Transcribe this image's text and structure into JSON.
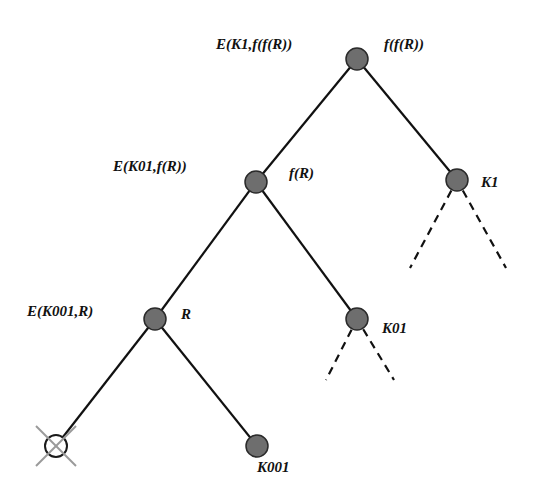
{
  "diagram": {
    "title": "",
    "colors": {
      "node_fill": "#6e6e6e",
      "node_stroke": "#2a2a2a",
      "edge": "#111111",
      "cross": "#9a9a9a",
      "label": "#111111"
    },
    "nodes": [
      {
        "id": "root",
        "x": 357,
        "y": 59,
        "type": "filled",
        "left_label": "E(K1,f(f(R))",
        "right_label": "f(f(R))"
      },
      {
        "id": "fR",
        "x": 256,
        "y": 182,
        "type": "filled",
        "left_label": "E(K01,f(R))",
        "right_label": "f(R)"
      },
      {
        "id": "K1",
        "x": 457,
        "y": 180,
        "type": "filled",
        "left_label": "",
        "right_label": "K1"
      },
      {
        "id": "R",
        "x": 155,
        "y": 319,
        "type": "filled",
        "left_label": "E(K001,R)",
        "right_label": "R"
      },
      {
        "id": "K01",
        "x": 357,
        "y": 319,
        "type": "filled",
        "left_label": "",
        "right_label": "K01"
      },
      {
        "id": "crossed",
        "x": 56,
        "y": 446,
        "type": "crossed",
        "left_label": "",
        "right_label": ""
      },
      {
        "id": "K001",
        "x": 257,
        "y": 446,
        "type": "filled",
        "left_label": "",
        "below_label": "K001"
      }
    ],
    "edges": [
      {
        "from": "root",
        "to": "fR",
        "style": "solid"
      },
      {
        "from": "root",
        "to": "K1",
        "style": "solid"
      },
      {
        "from": "fR",
        "to": "R",
        "style": "solid"
      },
      {
        "from": "fR",
        "to": "K01",
        "style": "solid"
      },
      {
        "from": "R",
        "to": "crossed",
        "style": "solid"
      },
      {
        "from": "R",
        "to": "K001",
        "style": "solid"
      }
    ],
    "dashed_stubs": [
      {
        "from": "K1",
        "x2": 410,
        "y2": 268
      },
      {
        "from": "K1",
        "x2": 506,
        "y2": 268
      },
      {
        "from": "K01",
        "x2": 326,
        "y2": 380
      },
      {
        "from": "K01",
        "x2": 394,
        "y2": 380
      }
    ],
    "labels": {
      "root_left": "E(K1,f(f(R))",
      "root_right": "f(f(R))",
      "fR_left": "E(K01,f(R))",
      "fR_right": "f(R)",
      "K1": "K1",
      "R_left": "E(K001,R)",
      "R_right": "R",
      "K01": "K01",
      "K001": "K001"
    }
  }
}
